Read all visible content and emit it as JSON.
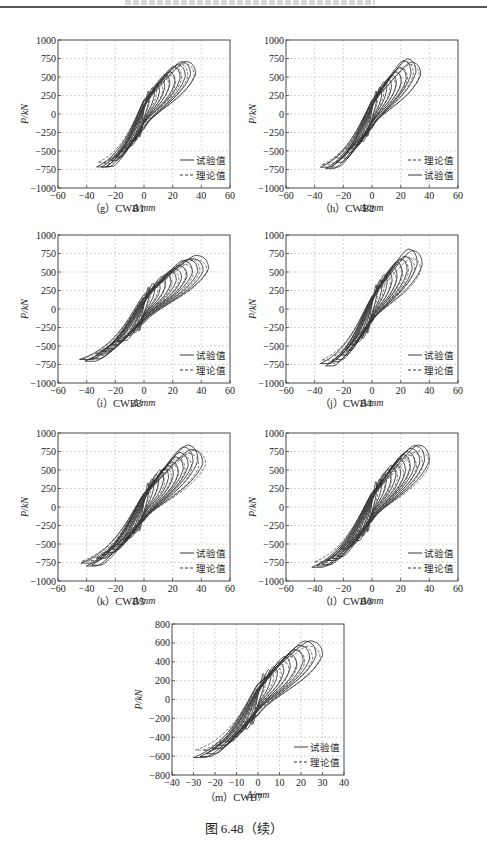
{
  "page": {
    "figure_caption": "图 6.48（续）"
  },
  "legend": {
    "test_label": "试验值",
    "theory_label": "理论值"
  },
  "axis_labels": {
    "xlabel": "Δ/mm",
    "ylabel": "P/kN"
  },
  "chart_data": [
    {
      "id": "g",
      "caption": "（g）CWB1",
      "type": "line",
      "title": "",
      "xlabel": "Δ/mm",
      "ylabel": "P/kN",
      "xlim": [
        -60,
        60
      ],
      "ylim": [
        -1000,
        1000
      ],
      "xticks": [
        -60,
        -40,
        -20,
        0,
        20,
        40,
        60
      ],
      "yticks": [
        -1000,
        -750,
        -500,
        -250,
        0,
        250,
        500,
        750,
        1000
      ],
      "grid": true,
      "legend_position": "lower right",
      "legend_order": [
        "试验值",
        "理论值"
      ],
      "series": [
        {
          "name": "试验值",
          "style": "solid",
          "max_disp": 36,
          "min_disp": -33,
          "peak_pos": 760,
          "peak_neg": -750,
          "cycles": 10
        },
        {
          "name": "理论值",
          "style": "dashed",
          "max_disp": 35,
          "min_disp": -32,
          "peak_pos": 700,
          "peak_neg": -700,
          "cycles": 8
        }
      ]
    },
    {
      "id": "h",
      "caption": "（h）CWB2",
      "type": "line",
      "title": "",
      "xlabel": "Δ/mm",
      "ylabel": "P/kN",
      "xlim": [
        -60,
        60
      ],
      "ylim": [
        -1000,
        1000
      ],
      "xticks": [
        -60,
        -40,
        -20,
        0,
        20,
        40,
        60
      ],
      "yticks": [
        -1000,
        -750,
        -500,
        -250,
        0,
        250,
        500,
        750,
        1000
      ],
      "grid": true,
      "legend_position": "lower right",
      "legend_order": [
        "理论值",
        "试验值"
      ],
      "series": [
        {
          "name": "试验值",
          "style": "solid",
          "max_disp": 34,
          "min_disp": -36,
          "peak_pos": 760,
          "peak_neg": -760,
          "cycles": 10
        },
        {
          "name": "理论值",
          "style": "dashed",
          "max_disp": 33,
          "min_disp": -35,
          "peak_pos": 720,
          "peak_neg": -700,
          "cycles": 8
        }
      ]
    },
    {
      "id": "i",
      "caption": "（i）CWB3",
      "type": "line",
      "title": "",
      "xlabel": "Δ/mm",
      "ylabel": "P/kN",
      "xlim": [
        -60,
        60
      ],
      "ylim": [
        -1000,
        1000
      ],
      "xticks": [
        -60,
        -40,
        -20,
        0,
        20,
        40,
        60
      ],
      "yticks": [
        -1000,
        -750,
        -500,
        -250,
        0,
        250,
        500,
        750,
        1000
      ],
      "grid": true,
      "legend_position": "lower right",
      "legend_order": [
        "试验值",
        "理论值"
      ],
      "series": [
        {
          "name": "试验值",
          "style": "solid",
          "max_disp": 45,
          "min_disp": -45,
          "peak_pos": 740,
          "peak_neg": -720,
          "cycles": 12
        },
        {
          "name": "理论值",
          "style": "dashed",
          "max_disp": 44,
          "min_disp": -43,
          "peak_pos": 700,
          "peak_neg": -680,
          "cycles": 9
        }
      ]
    },
    {
      "id": "j",
      "caption": "（j）CWB4",
      "type": "line",
      "title": "",
      "xlabel": "Δ/mm",
      "ylabel": "P/kN",
      "xlim": [
        -60,
        60
      ],
      "ylim": [
        -1000,
        1000
      ],
      "xticks": [
        -60,
        -40,
        -20,
        0,
        20,
        40,
        60
      ],
      "yticks": [
        -1000,
        -750,
        -500,
        -250,
        0,
        250,
        500,
        750,
        1000
      ],
      "grid": true,
      "legend_position": "lower right",
      "legend_order": [
        "试验值",
        "理论值"
      ],
      "series": [
        {
          "name": "试验值",
          "style": "solid",
          "max_disp": 35,
          "min_disp": -36,
          "peak_pos": 810,
          "peak_neg": -790,
          "cycles": 10
        },
        {
          "name": "理论值",
          "style": "dashed",
          "max_disp": 34,
          "min_disp": -35,
          "peak_pos": 740,
          "peak_neg": -740,
          "cycles": 8
        }
      ]
    },
    {
      "id": "k",
      "caption": "（k）CWB5",
      "type": "line",
      "title": "",
      "xlabel": "Δ/mm",
      "ylabel": "P/kN",
      "xlim": [
        -60,
        60
      ],
      "ylim": [
        -1000,
        1000
      ],
      "xticks": [
        -60,
        -40,
        -20,
        0,
        20,
        40,
        60
      ],
      "yticks": [
        -1000,
        -750,
        -500,
        -250,
        0,
        250,
        500,
        750,
        1000
      ],
      "grid": true,
      "legend_position": "lower right",
      "legend_order": [
        "试验值",
        "理论值"
      ],
      "series": [
        {
          "name": "试验值",
          "style": "solid",
          "max_disp": 41,
          "min_disp": -44,
          "peak_pos": 840,
          "peak_neg": -810,
          "cycles": 12
        },
        {
          "name": "理论值",
          "style": "dashed",
          "max_disp": 43,
          "min_disp": -43,
          "peak_pos": 780,
          "peak_neg": -760,
          "cycles": 9
        }
      ]
    },
    {
      "id": "l",
      "caption": "（l）CWB6",
      "type": "line",
      "title": "",
      "xlabel": "Δ/mm",
      "ylabel": "P/kN",
      "xlim": [
        -60,
        60
      ],
      "ylim": [
        -1000,
        1000
      ],
      "xticks": [
        -60,
        -40,
        -20,
        0,
        20,
        40,
        60
      ],
      "yticks": [
        -1000,
        -750,
        -500,
        -250,
        0,
        250,
        500,
        750,
        1000
      ],
      "grid": true,
      "legend_position": "lower right",
      "legend_order": [
        "试验值",
        "理论值"
      ],
      "series": [
        {
          "name": "试验值",
          "style": "solid",
          "max_disp": 40,
          "min_disp": -42,
          "peak_pos": 860,
          "peak_neg": -850,
          "cycles": 12
        },
        {
          "name": "理论值",
          "style": "dashed",
          "max_disp": 40,
          "min_disp": -40,
          "peak_pos": 780,
          "peak_neg": -780,
          "cycles": 9
        }
      ]
    },
    {
      "id": "m",
      "caption": "（m）CWB7",
      "type": "line",
      "title": "",
      "xlabel": "Δ/mm",
      "ylabel": "P/kN",
      "xlim": [
        -40,
        40
      ],
      "ylim": [
        -800,
        800
      ],
      "xticks": [
        -40,
        -30,
        -20,
        -10,
        0,
        10,
        20,
        30,
        40
      ],
      "yticks": [
        -800,
        -600,
        -400,
        -200,
        0,
        200,
        400,
        600,
        800
      ],
      "grid": true,
      "legend_position": "lower right",
      "legend_order": [
        "试验值",
        "理论值"
      ],
      "series": [
        {
          "name": "试验值",
          "style": "solid",
          "max_disp": 30,
          "min_disp": -30,
          "peak_pos": 650,
          "peak_neg": -640,
          "cycles": 10
        },
        {
          "name": "理论值",
          "style": "dashed",
          "max_disp": 29,
          "min_disp": -29,
          "peak_pos": 580,
          "peak_neg": -580,
          "cycles": 8
        }
      ]
    }
  ],
  "layout": [
    {
      "left": 58,
      "top": 40,
      "w": 172,
      "h": 148,
      "cap_x": 110,
      "cap_y": 206
    },
    {
      "left": 286,
      "top": 40,
      "w": 172,
      "h": 148,
      "cap_x": 340,
      "cap_y": 206
    },
    {
      "left": 58,
      "top": 235,
      "w": 172,
      "h": 148,
      "cap_x": 110,
      "cap_y": 401
    },
    {
      "left": 286,
      "top": 235,
      "w": 172,
      "h": 148,
      "cap_x": 340,
      "cap_y": 401
    },
    {
      "left": 58,
      "top": 433,
      "w": 172,
      "h": 148,
      "cap_x": 110,
      "cap_y": 599
    },
    {
      "left": 286,
      "top": 433,
      "w": 172,
      "h": 148,
      "cap_x": 340,
      "cap_y": 599
    },
    {
      "left": 172,
      "top": 624,
      "w": 172,
      "h": 151,
      "cap_x": 225,
      "cap_y": 795
    }
  ]
}
